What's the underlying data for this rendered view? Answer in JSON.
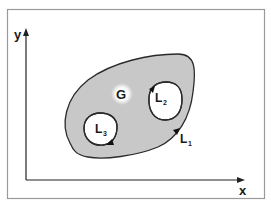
{
  "diagram": {
    "type": "planar region with holes",
    "axes": {
      "x_label": "x",
      "y_label": "y"
    },
    "region": {
      "label": "G",
      "fill_color": "#c8c8c8",
      "outline_color": "#2a2a2a"
    },
    "contours": [
      {
        "name": "L",
        "subscript": "1",
        "role": "outer boundary"
      },
      {
        "name": "L",
        "subscript": "2",
        "role": "inner hole boundary (right)"
      },
      {
        "name": "L",
        "subscript": "3",
        "role": "inner hole boundary (left)"
      }
    ],
    "colors": {
      "frame": "#9a9a9a",
      "axis": "#222222",
      "background": "#ffffff"
    }
  }
}
